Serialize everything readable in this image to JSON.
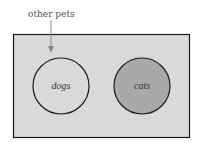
{
  "diagram": {
    "type": "venn",
    "universe": {
      "label": "other pets",
      "fill": "#d9d9d9",
      "stroke": "#1a1a1a"
    },
    "sets": [
      {
        "label": "dogs",
        "fill": "#d9d9d9",
        "stroke": "#1a1a1a"
      },
      {
        "label": "cats",
        "fill": "#a9a9a9",
        "stroke": "#1a1a1a"
      }
    ],
    "arrow_color": "#8a8a8a"
  }
}
